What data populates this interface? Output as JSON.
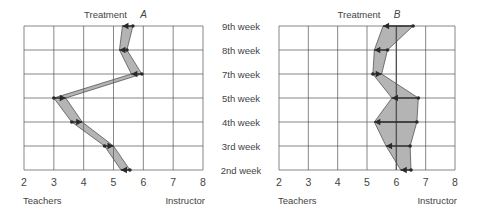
{
  "chart_data": [
    {
      "type": "line",
      "title": "Treatment A",
      "title_text": "Treatment",
      "title_letter": "A",
      "xlabel_left": "Teachers",
      "xlabel_right": "Instructor",
      "xlim": [
        2,
        8
      ],
      "xticks": [
        2,
        3,
        4,
        5,
        6,
        7,
        8
      ],
      "grid": true,
      "categories": [
        "9th week",
        "8th week",
        "7th week",
        "5th week",
        "4th week",
        "3rd week",
        "2nd week"
      ],
      "series": [
        {
          "name": "arrow-head",
          "values": [
            5.3,
            5.2,
            5.6,
            3.4,
            3.95,
            5.0,
            5.25
          ]
        },
        {
          "name": "dot",
          "values": [
            5.65,
            5.45,
            5.95,
            3.0,
            3.6,
            4.7,
            5.55
          ]
        }
      ]
    },
    {
      "type": "line",
      "title": "Treatment B",
      "title_text": "Treatment",
      "title_letter": "B",
      "xlabel_left": "Teachers",
      "xlabel_right": "Instructor",
      "xlim": [
        2,
        8
      ],
      "xticks": [
        2,
        3,
        4,
        5,
        6,
        7,
        8
      ],
      "grid": true,
      "reference_x": 6,
      "categories": [
        "9th week",
        "8th week",
        "7th week",
        "5th week",
        "4th week",
        "3rd week",
        "2nd week"
      ],
      "series": [
        {
          "name": "arrow-head",
          "values": [
            5.55,
            5.25,
            5.5,
            5.85,
            5.25,
            5.65,
            6.15
          ]
        },
        {
          "name": "dot",
          "values": [
            6.57,
            5.7,
            5.2,
            6.75,
            6.7,
            6.47,
            6.5
          ]
        }
      ]
    }
  ],
  "row_labels": [
    "9th week",
    "8th week",
    "7th week",
    "5th week",
    "4th week",
    "3rd week",
    "2nd week"
  ],
  "colors": {
    "fill": "#b4b4b4",
    "line": "#2a2a2a",
    "grid": "#555555"
  }
}
